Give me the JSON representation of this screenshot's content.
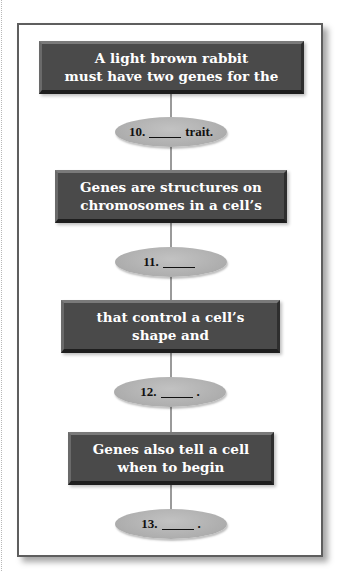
{
  "diagram": {
    "type": "flowchart",
    "colors": {
      "box_fill": "#4a4a4a",
      "box_text": "#ffffff",
      "oval_fill": "#adadad",
      "oval_text": "#111111",
      "connector": "#9a9a9a",
      "frame_border": "#5e5e5e"
    },
    "steps": [
      {
        "box": {
          "lines": [
            "A light brown rabbit",
            "must have two genes for the"
          ]
        },
        "oval": {
          "number": "10.",
          "suffix": "trait."
        }
      },
      {
        "box": {
          "lines": [
            "Genes are structures on",
            "chromosomes in a cell’s"
          ]
        },
        "oval": {
          "number": "11.",
          "suffix": ""
        }
      },
      {
        "box": {
          "lines": [
            "that control a cell’s",
            "shape and"
          ]
        },
        "oval": {
          "number": "12.",
          "suffix": "."
        }
      },
      {
        "box": {
          "lines": [
            "Genes also tell a cell",
            "when to begin"
          ]
        },
        "oval": {
          "number": "13.",
          "suffix": "."
        }
      }
    ]
  }
}
